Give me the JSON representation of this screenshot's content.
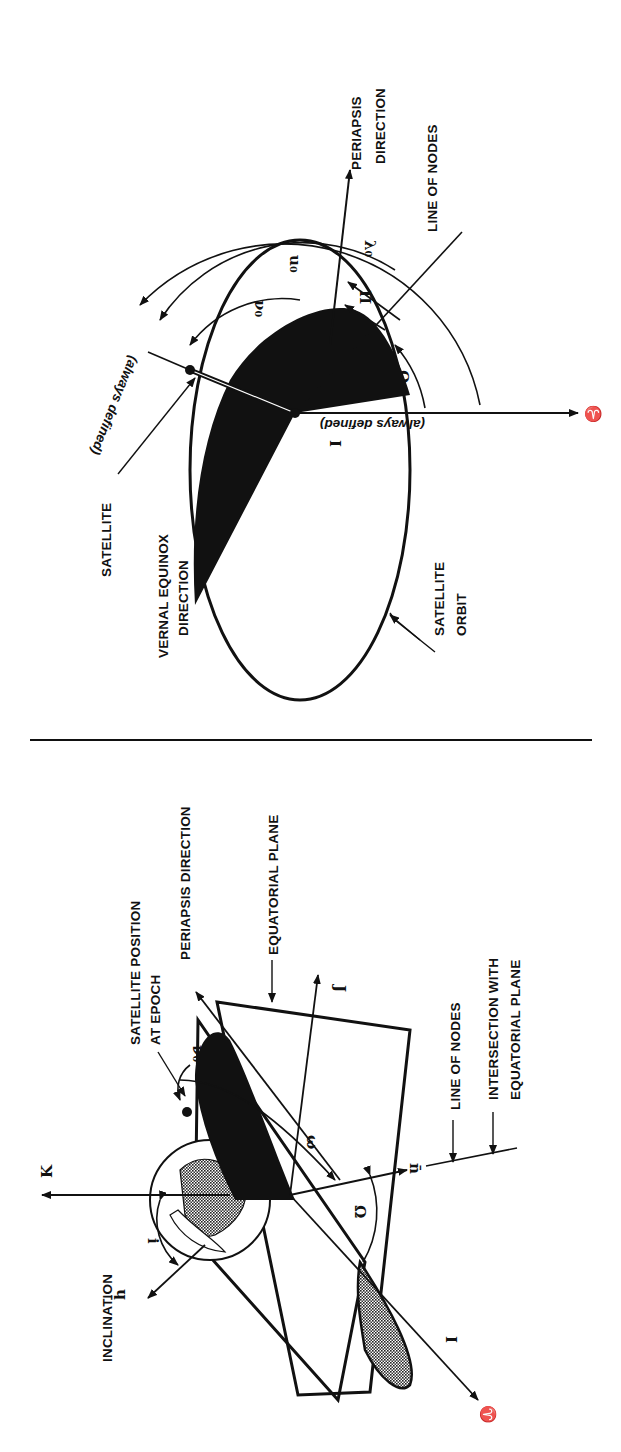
{
  "figure": {
    "orientation": "rotated 90deg clockwise",
    "ink_color": "#111111",
    "background": "#ffffff",
    "divider": "horizontal rule separating two panels"
  },
  "right_panel": {
    "title": "Orbit plane view",
    "labels": {
      "periapsis": [
        "PERIAPSIS",
        "DIRECTION"
      ],
      "line_of_nodes": "LINE OF NODES",
      "satellite": "SATELLITE",
      "vernal_equinox": [
        "VERNAL EQUINOX",
        "DIRECTION"
      ],
      "satellite_orbit": [
        "SATELLITE",
        "ORBIT"
      ],
      "always_defined_1": "(always defined)",
      "always_defined_2": "(always defined)"
    },
    "symbols": {
      "nu0": "ν₀",
      "u0": "u₀",
      "lambda0": "λ₀",
      "omega": "ω",
      "Pi": "Π",
      "Omega": "Ω",
      "I": "I",
      "aries": "♈"
    }
  },
  "left_panel": {
    "title": "3D orbital geometry",
    "labels": {
      "satellite_position": [
        "SATELLITE POSITION",
        "AT EPOCH"
      ],
      "periapsis": "PERIAPSIS DIRECTION",
      "equatorial_plane": "EQUATORIAL PLANE",
      "line_of_nodes": "LINE OF NODES",
      "intersection": [
        "INTERSECTION WITH",
        "EQUATORIAL PLANE"
      ],
      "inclination": "INCLINATION"
    },
    "symbols": {
      "K": "K",
      "J": "J",
      "I": "I",
      "i": "i",
      "h": "h̄",
      "n": "n̄",
      "nu0": "ν₀",
      "omega": "ω",
      "Omega": "Ω",
      "aries": "♈"
    }
  }
}
